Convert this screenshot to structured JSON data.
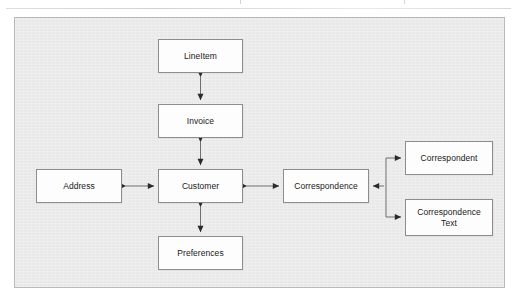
{
  "diagram": {
    "frame": {
      "background_color": "#e9e9e9",
      "border_color": "#b9b9b9"
    },
    "node_style": {
      "fill_color": "#fdfdfd",
      "border_color": "#8d8d8d",
      "text_color": "#1a1a1a"
    },
    "edge_style": {
      "line_color": "#2a2a2a",
      "arrowhead": "filled-triangle"
    },
    "nodes": [
      {
        "id": "lineitem",
        "label": "LineItem",
        "x": 158,
        "y": 39,
        "w": 85,
        "h": 34
      },
      {
        "id": "invoice",
        "label": "Invoice",
        "x": 158,
        "y": 104,
        "w": 85,
        "h": 34
      },
      {
        "id": "customer",
        "label": "Customer",
        "x": 158,
        "y": 169,
        "w": 85,
        "h": 34
      },
      {
        "id": "preferences",
        "label": "Preferences",
        "x": 158,
        "y": 236,
        "w": 85,
        "h": 34
      },
      {
        "id": "address",
        "label": "Address",
        "x": 36,
        "y": 169,
        "w": 86,
        "h": 34
      },
      {
        "id": "correspondence",
        "label": "Correspondence",
        "x": 283,
        "y": 169,
        "w": 86,
        "h": 34
      },
      {
        "id": "correspondent",
        "label": "Correspondent",
        "x": 405,
        "y": 141,
        "w": 88,
        "h": 34
      },
      {
        "id": "correspondence-text",
        "label": "Correspondence\nText",
        "x": 405,
        "y": 199,
        "w": 88,
        "h": 37
      }
    ],
    "edges": [
      {
        "id": "lineitem-invoice",
        "from": "lineitem",
        "to": "invoice",
        "direction": "bidirectional",
        "orientation": "vertical"
      },
      {
        "id": "invoice-customer",
        "from": "invoice",
        "to": "customer",
        "direction": "bidirectional",
        "orientation": "vertical"
      },
      {
        "id": "customer-preferences",
        "from": "customer",
        "to": "preferences",
        "direction": "bidirectional",
        "orientation": "vertical"
      },
      {
        "id": "address-customer",
        "from": "address",
        "to": "customer",
        "direction": "bidirectional",
        "orientation": "horizontal"
      },
      {
        "id": "customer-correspondence",
        "from": "customer",
        "to": "correspondence",
        "direction": "bidirectional",
        "orientation": "horizontal"
      },
      {
        "id": "correspondent-correspondence",
        "from": "correspondent",
        "to": "correspondence",
        "direction": "bidirectional",
        "orientation": "branch"
      },
      {
        "id": "correspondencetext-correspondence",
        "from": "correspondence-text",
        "to": "correspondence",
        "direction": "bidirectional",
        "orientation": "branch"
      }
    ]
  }
}
